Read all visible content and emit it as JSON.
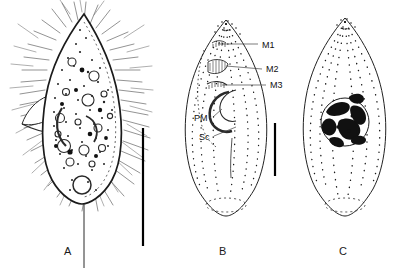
{
  "figure": {
    "kind": "scientific-line-drawing",
    "background_color": "#ffffff",
    "ink_color": "#1a1a1a",
    "panel_count": 3
  },
  "panels": [
    {
      "id": "A",
      "letter": "A",
      "letter_x": 64,
      "letter_y": 252,
      "description": "detailed stippled life drawing with somatic cilia, cytoplasmic inclusions, contractile vacuole and lateral oral lobe",
      "has_cilia": true,
      "has_scale_bar": true
    },
    {
      "id": "B",
      "letter": "B",
      "letter_x": 219,
      "letter_y": 252,
      "description": "ventral schematic of infraciliature showing oral membranelles and kineties",
      "has_cilia": false,
      "has_scale_bar": true
    },
    {
      "id": "C",
      "letter": "C",
      "letter_x": 339,
      "letter_y": 252,
      "description": "dorsal schematic showing dotted kinety rows and blotched macronucleus",
      "has_cilia": false,
      "has_scale_bar": false
    }
  ],
  "annotations": [
    {
      "text": "M1",
      "x": 262,
      "y": 47,
      "target": "membranelle-1",
      "panel": "B"
    },
    {
      "text": "M2",
      "x": 266,
      "y": 72,
      "target": "membranelle-2",
      "panel": "B"
    },
    {
      "text": "M3",
      "x": 270,
      "y": 88,
      "target": "membranelle-3",
      "panel": "B"
    },
    {
      "text": "PM",
      "x": 194,
      "y": 121,
      "target": "paroral-membrane",
      "panel": "B"
    },
    {
      "text": "Sc",
      "x": 199,
      "y": 140,
      "target": "somatic-kinety",
      "panel": "B"
    }
  ],
  "scale_bars": [
    {
      "name": "scale-bar-panel-a",
      "x": 143,
      "y1": 128,
      "y2": 246
    },
    {
      "name": "scale-bar-panel-b",
      "x": 275,
      "y1": 123,
      "y2": 176
    }
  ],
  "structures": {
    "macronucleus": {
      "panel": "C",
      "cx": 345,
      "cy": 122,
      "r": 24,
      "fill": "#111111"
    },
    "contractile_vacuole_a": {
      "panel": "A",
      "cx": 82,
      "cy": 185,
      "r": 9
    },
    "contractile_vacuole_b": {
      "panel": "B",
      "cx": 226,
      "cy": 205,
      "rx": 20,
      "ry": 7
    }
  }
}
